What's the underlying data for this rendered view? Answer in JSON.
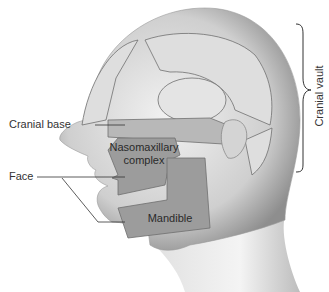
{
  "diagram": {
    "type": "anatomical-illustration",
    "labels": {
      "cranial_base": "Cranial base",
      "face": "Face",
      "cranial_vault": "Cranial vault",
      "nasomaxillary_line1": "Nasomaxillary",
      "nasomaxillary_line2": "complex",
      "mandible": "Mandible"
    },
    "colors": {
      "skin_light": "#ececec",
      "skin_shade": "#9a9a9a",
      "region_fill_light": "#d9d9d9",
      "region_fill_dark": "#9c9c9c",
      "outline": "#6f6f6f",
      "leader_line": "#333333"
    }
  }
}
